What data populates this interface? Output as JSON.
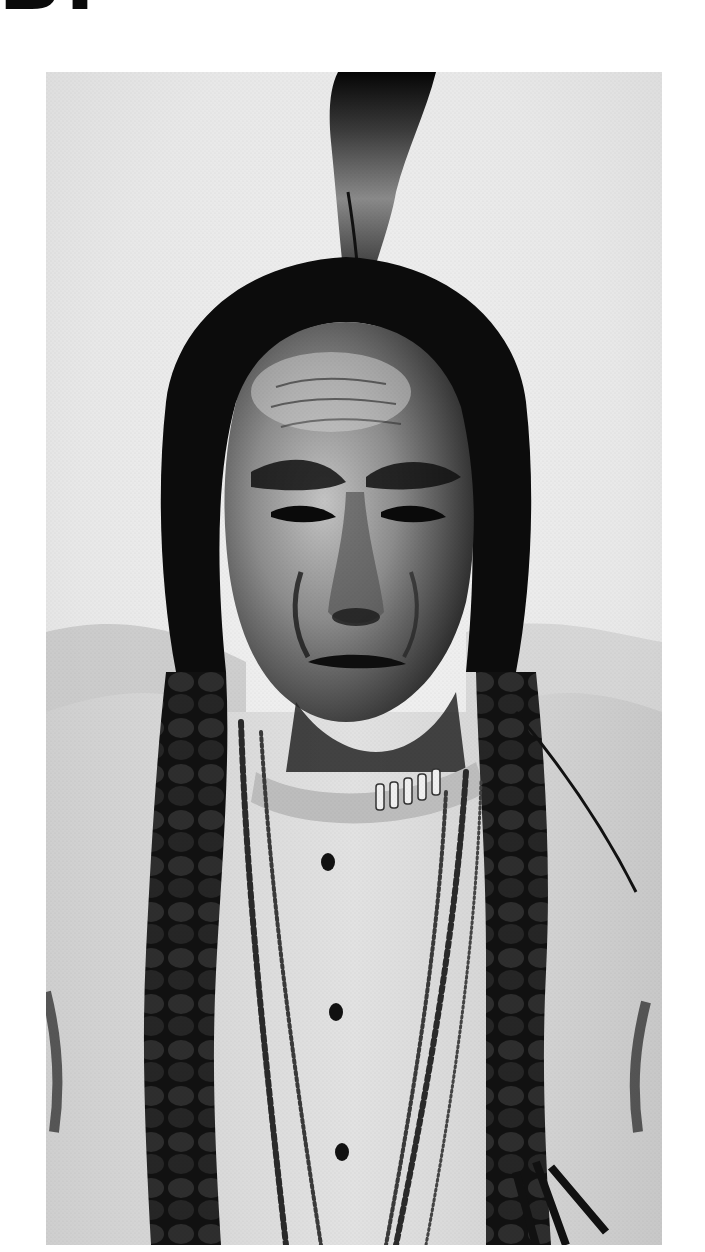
{
  "page": {
    "header_glyph": "B.",
    "background": "#ffffff"
  },
  "photo": {
    "kind": "black-and-white archival portrait photograph",
    "description": "Half-length portrait of a man with long dark hair parted in the center, a single upright feather at the crown, two long braids falling over the chest, a light shirt, and multiple bead and chain necklaces",
    "tones": {
      "background": "#e6e6e6",
      "hair": "#0d0d0d",
      "skin_highlight": "#bdbdbd",
      "skin_shadow": "#2a2a2a",
      "shirt": "#d9d9d9",
      "necklace": "#3a3a3a"
    },
    "bounds": {
      "left": 46,
      "top": 72,
      "width": 616,
      "height": 1173
    }
  }
}
